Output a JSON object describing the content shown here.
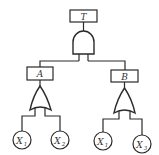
{
  "diagram": {
    "type": "fault-tree",
    "top_event": {
      "id": "T",
      "label": "T",
      "gate": "AND"
    },
    "intermediate_events": [
      {
        "id": "A",
        "label": "A",
        "gate": "OR",
        "inputs": [
          "X1",
          "X2"
        ]
      },
      {
        "id": "B",
        "label": "B",
        "gate": "OR",
        "inputs": [
          "X1",
          "X3"
        ]
      }
    ],
    "basic_events": [
      {
        "label": "X",
        "sub": "1"
      },
      {
        "label": "X",
        "sub": "2"
      },
      {
        "label": "X",
        "sub": "1"
      },
      {
        "label": "X",
        "sub": "3"
      }
    ],
    "colors": {
      "line": "#2a2a2a",
      "text": "#333333",
      "background": "#ffffff"
    }
  }
}
